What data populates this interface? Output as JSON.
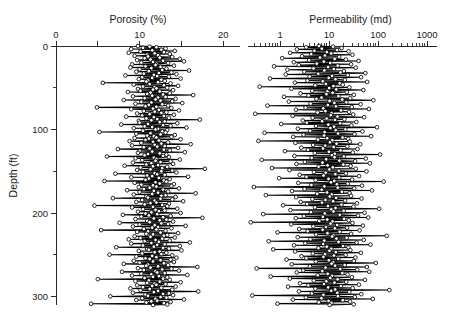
{
  "figure": {
    "background_color": "#ffffff",
    "line_color": "#000000",
    "marker_fill": "#ffffff",
    "axis_color": "#2b2b2b"
  },
  "chart_data": {
    "type": "line",
    "title": "",
    "orientation": "vertical-well-log",
    "grid": false,
    "legend": null,
    "ylabel": "Depth (ft)",
    "ylim": [
      0,
      310
    ],
    "y_major_ticks": [
      0,
      100,
      200,
      300
    ],
    "y_minor_ticks": [
      50,
      150,
      250
    ],
    "panels": [
      {
        "name": "porosity",
        "xlabel": "Porosity (%)",
        "xscale": "linear",
        "xlim": [
          0,
          22
        ],
        "x_ticks": [
          0,
          5,
          10,
          15,
          20
        ],
        "x_tick_labels": [
          "0",
          "",
          "10",
          "",
          "20"
        ],
        "series_name": "Porosity",
        "marker": "open-circle",
        "x": [
          9.8,
          11.2,
          12.0,
          10.4,
          13.1,
          9.0,
          12.6,
          11.5,
          14.2,
          10.1,
          12.9,
          8.7,
          11.8,
          13.6,
          10.9,
          12.2,
          9.4,
          11.0,
          13.9,
          12.4,
          10.6,
          14.8,
          11.3,
          9.7,
          12.8,
          15.3,
          11.6,
          10.2,
          13.4,
          12.0,
          9.1,
          11.9,
          14.1,
          10.7,
          12.5,
          8.9,
          11.4,
          13.2,
          10.0,
          12.7,
          15.9,
          11.1,
          9.6,
          13.8,
          12.3,
          10.5,
          14.4,
          11.7,
          8.3,
          12.1,
          13.5,
          10.3,
          11.5,
          14.9,
          9.9,
          12.6,
          11.0,
          13.0,
          10.8,
          12.2,
          5.6,
          13.7,
          11.2,
          9.3,
          12.9,
          14.6,
          10.4,
          11.8,
          13.3,
          12.0,
          9.8,
          11.6,
          14.0,
          10.1,
          12.4,
          8.6,
          11.3,
          13.6,
          10.9,
          12.8,
          16.4,
          11.5,
          9.2,
          13.1,
          12.2,
          10.6,
          14.3,
          11.9,
          8.1,
          12.5,
          13.9,
          10.2,
          11.4,
          15.1,
          9.5,
          12.7,
          11.1,
          13.4,
          10.7,
          12.0,
          4.9,
          13.8,
          11.6,
          9.0,
          12.3,
          14.7,
          10.5,
          11.8,
          13.2,
          12.6,
          9.7,
          11.2,
          14.1,
          10.3,
          12.9,
          8.4,
          11.7,
          13.5,
          10.8,
          12.1,
          17.2,
          11.4,
          9.9,
          13.0,
          12.4,
          10.0,
          14.5,
          11.0,
          7.8,
          12.8,
          13.7,
          10.6,
          11.5,
          15.6,
          9.3,
          12.2,
          11.9,
          13.3,
          10.4,
          12.7,
          5.2,
          13.1,
          11.3,
          9.6,
          12.5,
          14.2,
          10.9,
          11.7,
          13.8,
          12.0,
          9.4,
          11.1,
          14.9,
          10.7,
          12.3,
          8.8,
          11.6,
          13.4,
          10.2,
          12.6,
          16.1,
          11.8,
          9.1,
          13.0,
          12.1,
          10.5,
          14.6,
          11.2,
          7.4,
          12.9,
          13.6,
          10.0,
          11.5,
          15.4,
          9.8,
          12.4,
          11.0,
          13.2,
          10.6,
          12.8,
          6.1,
          13.5,
          11.7,
          9.5,
          12.0,
          14.8,
          10.3,
          11.9,
          13.7,
          12.5,
          9.2,
          11.4,
          14.0,
          10.8,
          12.2,
          8.2,
          11.6,
          13.3,
          10.1,
          12.7,
          17.8,
          11.3,
          9.7,
          13.9,
          12.6,
          10.4,
          14.4,
          11.8,
          7.1,
          12.1,
          13.0,
          10.9,
          11.5,
          15.8,
          9.0,
          12.3,
          11.1,
          13.6,
          10.7,
          12.9,
          5.8,
          13.2,
          11.9,
          9.4,
          12.4,
          14.1,
          10.2,
          11.6,
          13.8,
          12.0,
          9.9,
          11.2,
          14.7,
          10.5,
          12.8,
          8.5,
          11.7,
          13.4,
          10.0,
          12.2,
          16.7,
          11.5,
          9.3,
          13.1,
          12.6,
          10.8,
          14.3,
          11.0,
          6.8,
          12.5,
          13.9,
          10.3,
          11.8,
          15.2,
          9.6,
          12.0,
          11.3,
          13.5,
          10.6,
          12.7,
          4.6,
          13.3,
          11.6,
          9.1,
          12.9,
          14.5,
          10.4,
          11.9,
          13.0,
          12.3,
          9.8,
          11.4,
          14.9,
          10.7,
          12.1,
          8.0,
          11.1,
          13.7,
          10.2,
          12.8,
          17.5,
          11.7,
          9.5,
          13.2,
          12.4,
          10.9,
          14.0,
          11.2,
          7.6,
          12.6,
          13.4,
          10.0,
          11.8,
          15.5,
          9.2,
          12.2,
          11.5,
          13.8,
          10.5,
          12.0,
          5.4,
          13.1,
          11.0,
          9.7,
          12.5,
          14.6,
          10.8,
          11.6,
          13.3,
          12.9,
          9.4,
          11.3,
          14.2,
          10.1,
          12.7,
          8.7,
          11.9,
          13.6,
          10.6,
          12.3,
          16.0,
          11.4,
          9.0,
          13.0,
          12.1,
          10.4,
          14.8,
          11.7,
          7.2,
          12.8,
          13.5,
          10.9,
          11.1,
          15.0,
          9.9,
          12.4,
          11.8,
          13.2,
          10.3,
          12.6,
          6.4,
          13.9,
          11.5,
          9.6,
          12.0,
          14.4,
          10.7,
          11.2,
          13.7,
          12.5,
          9.3,
          11.6,
          14.1,
          10.0,
          12.9,
          8.1,
          11.0,
          13.4,
          10.8,
          12.2,
          16.9,
          11.3,
          9.8,
          13.8,
          12.7,
          10.5,
          14.7,
          11.9,
          7.9,
          12.1,
          13.0,
          10.2,
          11.4,
          15.7,
          9.1,
          12.3,
          11.6,
          13.3,
          10.6,
          12.8,
          5.0,
          13.6,
          11.1,
          9.5,
          12.4,
          14.9,
          10.9,
          11.8,
          13.1,
          12.0,
          9.7,
          11.5,
          14.3,
          10.4,
          12.6,
          8.9,
          11.2,
          13.9,
          10.1,
          12.2,
          17.0,
          11.7,
          9.2,
          13.5,
          12.8,
          10.7,
          14.0,
          11.0,
          6.5,
          12.5,
          13.2,
          10.3,
          11.9,
          15.3,
          9.6,
          12.1,
          11.4,
          13.7,
          10.8,
          12.9,
          4.2,
          13.3,
          11.6
        ]
      },
      {
        "name": "permeability",
        "xlabel": "Permeability (md)",
        "xscale": "log",
        "xlim": [
          0.22,
          1600
        ],
        "x_ticks": [
          1,
          10,
          100,
          1000
        ],
        "x_tick_labels": [
          "1",
          "10",
          "100",
          "1000"
        ],
        "series_name": "Permeability",
        "marker": "open-circle",
        "x": [
          6.2,
          12.0,
          3.4,
          18.0,
          7.1,
          2.2,
          14.5,
          5.0,
          25.0,
          9.0,
          1.6,
          11.0,
          4.3,
          30.0,
          8.2,
          2.8,
          16.0,
          6.5,
          1.1,
          13.0,
          22.0,
          3.9,
          40.0,
          7.8,
          1.9,
          10.5,
          5.6,
          28.0,
          2.4,
          15.0,
          0.75,
          9.5,
          35.0,
          4.8,
          12.5,
          1.4,
          8.0,
          20.0,
          3.1,
          17.0,
          55.0,
          6.0,
          1.3,
          24.0,
          11.5,
          4.0,
          45.0,
          9.8,
          0.62,
          13.5,
          21.0,
          3.6,
          7.4,
          60.0,
          2.0,
          16.5,
          8.6,
          19.0,
          5.2,
          12.2,
          0.38,
          26.0,
          10.0,
          1.7,
          14.0,
          50.0,
          4.5,
          9.2,
          23.0,
          11.8,
          2.6,
          8.8,
          32.0,
          3.8,
          15.5,
          1.2,
          7.0,
          27.0,
          5.5,
          18.5,
          80.0,
          10.2,
          1.5,
          22.5,
          12.8,
          4.2,
          44.0,
          9.4,
          0.55,
          13.8,
          29.0,
          3.3,
          7.6,
          65.0,
          2.1,
          17.5,
          8.4,
          25.5,
          5.8,
          11.2,
          0.31,
          31.0,
          10.8,
          1.8,
          14.8,
          52.0,
          4.6,
          8.9,
          20.5,
          13.2,
          2.9,
          7.2,
          36.0,
          3.5,
          16.8,
          1.05,
          9.6,
          28.5,
          5.4,
          12.6,
          95.0,
          10.6,
          2.3,
          21.5,
          13.6,
          4.1,
          48.0,
          8.1,
          0.48,
          15.2,
          33.0,
          3.0,
          7.9,
          72.0,
          1.85,
          18.8,
          9.1,
          24.5,
          5.9,
          11.6,
          0.36,
          26.5,
          10.4,
          2.05,
          14.2,
          43.0,
          4.7,
          8.3,
          23.5,
          12.4,
          2.7,
          7.5,
          38.0,
          3.7,
          17.2,
          1.25,
          9.9,
          30.5,
          5.1,
          13.0,
          110.0,
          11.4,
          1.95,
          20.0,
          12.9,
          4.4,
          56.0,
          8.7,
          0.42,
          16.2,
          34.0,
          3.2,
          7.3,
          68.0,
          2.15,
          19.5,
          9.3,
          27.5,
          6.1,
          11.9,
          0.68,
          35.0,
          10.1,
          1.55,
          15.8,
          58.0,
          4.9,
          8.5,
          22.0,
          13.4,
          2.5,
          7.7,
          41.0,
          3.45,
          16.0,
          0.95,
          9.7,
          29.5,
          5.3,
          12.7,
          130.0,
          10.9,
          2.35,
          24.0,
          14.4,
          4.35,
          47.0,
          8.0,
          0.29,
          15.0,
          32.5,
          3.15,
          7.05,
          75.0,
          1.75,
          18.2,
          9.05,
          26.2,
          5.7,
          11.3,
          0.51,
          28.0,
          10.3,
          2.12,
          13.9,
          46.0,
          4.55,
          8.4,
          21.2,
          12.1,
          2.62,
          7.15,
          37.0,
          3.55,
          17.8,
          1.15,
          9.45,
          31.5,
          5.15,
          13.5,
          105.0,
          11.1,
          1.62,
          19.8,
          12.3,
          4.25,
          53.0,
          8.15,
          0.45,
          16.5,
          39.0,
          3.05,
          7.45,
          63.0,
          2.08,
          20.2,
          9.15,
          25.2,
          6.3,
          11.7,
          0.25,
          30.0,
          10.7,
          1.68,
          14.6,
          49.0,
          4.75,
          8.6,
          23.2,
          13.1,
          2.45,
          7.35,
          42.0,
          3.65,
          16.4,
          0.88,
          9.25,
          28.2,
          5.45,
          12.2,
          150.0,
          11.5,
          2.28,
          22.8,
          14.1,
          4.15,
          51.0,
          7.95,
          0.58,
          15.6,
          36.5,
          3.25,
          7.55,
          70.0,
          1.92,
          19.2,
          8.95,
          24.8,
          6.05,
          11.05,
          0.72,
          27.2,
          10.15,
          2.02,
          13.7,
          44.5,
          4.65,
          8.25,
          21.8,
          12.55,
          2.72,
          7.65,
          34.5,
          3.42,
          15.4,
          1.35,
          9.85,
          32.0,
          5.35,
          12.05,
          90.0,
          11.25,
          1.72,
          20.8,
          13.25,
          4.05,
          59.0,
          8.45,
          0.33,
          16.9,
          37.5,
          2.95,
          7.25,
          66.0,
          2.18,
          18.6,
          9.35,
          23.8,
          5.85,
          11.45,
          0.64,
          29.2,
          10.55,
          1.58,
          14.9,
          54.0,
          4.85,
          8.75,
          22.4,
          12.85,
          2.55,
          7.85,
          40.5,
          3.75,
          17.4,
          1.45,
          9.55,
          30.2,
          5.25,
          13.3,
          170.0,
          11.05,
          2.42,
          25.8,
          14.7,
          4.45,
          45.5,
          7.65,
          0.27,
          15.1,
          33.5,
          3.35,
          6.95,
          78.0,
          1.82,
          19.0,
          9.75,
          26.8,
          6.15,
          11.15,
          0.88,
          31.8,
          10.25
        ]
      }
    ]
  }
}
